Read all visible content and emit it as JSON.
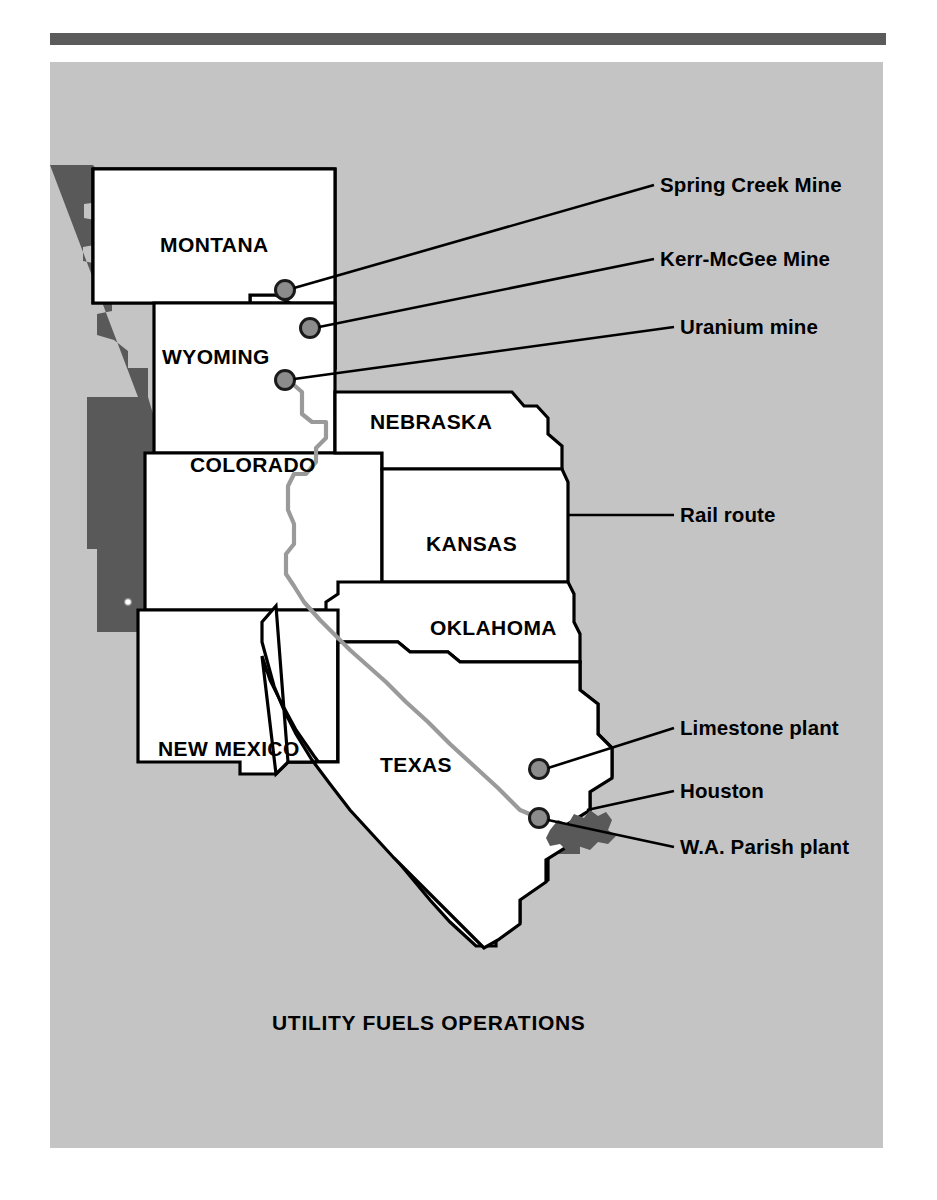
{
  "figure": {
    "number_label": "FIGURE 14.14",
    "map_title": "UTILITY FUELS OPERATIONS"
  },
  "colors": {
    "panel_background": "#c4c4c4",
    "land_fill": "#ffffff",
    "land_stroke": "#000000",
    "offmap_shadow": "#595959",
    "marker_fill": "#8c8c8c",
    "marker_stroke": "#1a1a1a",
    "rail_route_line": "#9a9a9a",
    "houston_blob": "#595959",
    "rule_bar": "#5b5b5b",
    "label_text": "#000000"
  },
  "map": {
    "states": [
      {
        "id": "montana",
        "label": "MONTANA",
        "label_x": 160,
        "label_y": 183
      },
      {
        "id": "wyoming",
        "label": "WYOMING",
        "label_x": 112,
        "label_y": 297
      },
      {
        "id": "nebraska",
        "label": "NEBRASKA",
        "label_x": 312,
        "label_y": 363
      },
      {
        "id": "colorado",
        "label": "COLORADO",
        "label_x": 142,
        "label_y": 405
      },
      {
        "id": "kansas",
        "label": "KANSAS",
        "label_x": 372,
        "label_y": 488
      },
      {
        "id": "oklahoma",
        "label": "OKLAHOMA",
        "label_x": 380,
        "label_y": 572
      },
      {
        "id": "new-mexico",
        "label": "NEW MEXICO",
        "label_x": 110,
        "label_y": 692
      },
      {
        "id": "texas",
        "label": "TEXAS",
        "label_x": 328,
        "label_y": 708
      }
    ],
    "markers": [
      {
        "id": "spring-creek-mine",
        "x": 235,
        "y": 228
      },
      {
        "id": "kerr-mcgee-mine",
        "x": 260,
        "y": 266
      },
      {
        "id": "uranium-mine",
        "x": 235,
        "y": 318
      },
      {
        "id": "limestone-plant",
        "x": 489,
        "y": 707
      },
      {
        "id": "wa-parish-plant",
        "x": 489,
        "y": 756
      }
    ],
    "callouts": [
      {
        "id": "spring-creek-mine",
        "label": "Spring Creek Mine",
        "text_x": 613,
        "text_y": 128,
        "line": "M 244 226 L 604 123"
      },
      {
        "id": "kerr-mcgee-mine",
        "label": "Kerr-McGee Mine",
        "text_x": 613,
        "text_y": 202,
        "line": "M 269 265 L 604 197"
      },
      {
        "id": "uranium-mine",
        "label": "Uranium mine",
        "text_x": 632,
        "text_y": 270,
        "line": "M 244 317 L 624 265"
      },
      {
        "id": "rail-route",
        "label": "Rail route",
        "text_x": 632,
        "text_y": 457,
        "line": "M 525 453 L 624 453"
      },
      {
        "id": "limestone-plant",
        "label": "Limestone plant",
        "text_x": 632,
        "text_y": 671,
        "line": "M 498 706 L 624 666"
      },
      {
        "id": "houston",
        "label": "Houston",
        "text_x": 632,
        "text_y": 734,
        "line": "M 535 745 L 624 729"
      },
      {
        "id": "wa-parish-plant",
        "label": "W.A. Parish plant",
        "text_x": 632,
        "text_y": 790,
        "line": "M 498 757 L 624 785"
      }
    ],
    "houston_area_name": "Houston",
    "rail_route_name": "Rail route"
  }
}
